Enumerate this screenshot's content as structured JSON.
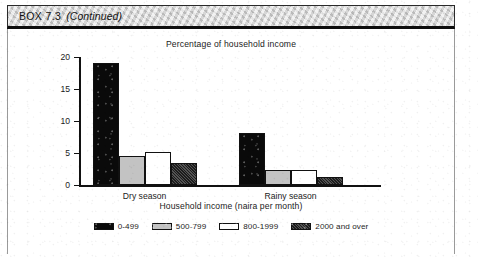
{
  "box": {
    "label": "BOX 7.3",
    "continued": "(Continued)"
  },
  "chart_data": {
    "type": "bar",
    "title": "Percentage of household income",
    "xlabel": "Household income (naira per month)",
    "ylabel": "",
    "categories": [
      "Dry season",
      "Rainy season"
    ],
    "ylim": [
      0,
      20
    ],
    "yticks": [
      "0",
      "5",
      "10",
      "15",
      "20"
    ],
    "ytick_values": [
      0,
      5,
      10,
      15,
      20
    ],
    "grid": false,
    "legend_position": "bottom",
    "series": [
      {
        "name": "0-499",
        "color": "#0a0a0a",
        "values": [
          19.0,
          8.2
        ]
      },
      {
        "name": "500-799",
        "color": "#c3c3c3",
        "values": [
          4.5,
          2.4
        ]
      },
      {
        "name": "800-1999",
        "color": "#ffffff",
        "values": [
          5.2,
          2.4
        ]
      },
      {
        "name": "2000 and over",
        "color": "#3f3f3f",
        "values": [
          3.5,
          1.2
        ]
      }
    ]
  }
}
